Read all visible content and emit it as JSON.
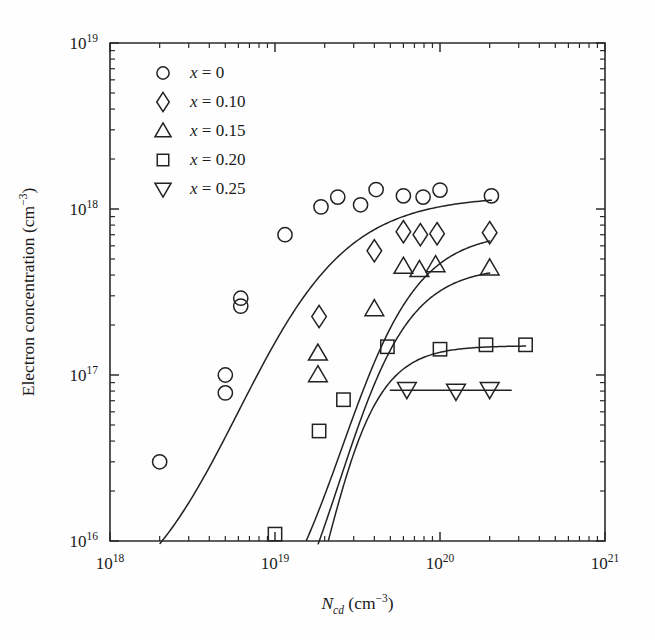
{
  "chart_data": {
    "type": "scatter",
    "title": "",
    "xlabel": "N_cd (cm^-3)",
    "ylabel": "Electron concentration (cm^-3)",
    "xscale": "log",
    "yscale": "log",
    "xlim": [
      1e+18,
      1e+21
    ],
    "ylim": [
      1e+16,
      1e+19
    ],
    "grid": false,
    "legend_position": "top-left inside",
    "xtick_labels": [
      "10^18",
      "10^19",
      "10^20",
      "10^21"
    ],
    "xtick_values": [
      1e+18,
      1e+19,
      1e+20,
      1e+21
    ],
    "ytick_labels": [
      "10^16",
      "10^17",
      "10^18",
      "10^19"
    ],
    "ytick_values": [
      1e+16,
      1e+17,
      1e+18,
      1e+19
    ],
    "series": [
      {
        "name": "x = 0",
        "marker": "circle",
        "points": [
          [
            2e+18,
            3e+16
          ],
          [
            5e+18,
            1e+17
          ],
          [
            5e+18,
            7.8e+16
          ],
          [
            6.2e+18,
            2.9e+17
          ],
          [
            6.2e+18,
            2.6e+17
          ],
          [
            1.15e+19,
            7e+17
          ],
          [
            1.9e+19,
            1.03e+18
          ],
          [
            2.4e+19,
            1.18e+18
          ],
          [
            3.3e+19,
            1.06e+18
          ],
          [
            4.1e+19,
            1.31e+18
          ],
          [
            6e+19,
            1.2e+18
          ],
          [
            7.9e+19,
            1.18e+18
          ],
          [
            1e+20,
            1.3e+18
          ],
          [
            2.05e+20,
            1.2e+18
          ]
        ],
        "fit_plateau": 1.2e+18
      },
      {
        "name": "x = 0.10",
        "marker": "diamond",
        "points": [
          [
            1.85e+19,
            2.25e+17
          ],
          [
            4e+19,
            5.6e+17
          ],
          [
            6e+19,
            7.3e+17
          ],
          [
            7.6e+19,
            7e+17
          ],
          [
            9.6e+19,
            7.1e+17
          ],
          [
            2e+20,
            7.2e+17
          ]
        ],
        "fit_plateau": 7.3e+17
      },
      {
        "name": "x = 0.15",
        "marker": "triangle-up",
        "points": [
          [
            1.82e+19,
            1.35e+17
          ],
          [
            1.82e+19,
            1e+17
          ],
          [
            4e+19,
            2.5e+17
          ],
          [
            6e+19,
            4.5e+17
          ],
          [
            7.5e+19,
            4.3e+17
          ],
          [
            9.4e+19,
            4.6e+17
          ],
          [
            2e+20,
            4.4e+17
          ]
        ],
        "fit_plateau": 4.5e+17
      },
      {
        "name": "x = 0.20",
        "marker": "square",
        "points": [
          [
            1e+19,
            1.1e+16
          ],
          [
            1.85e+19,
            4.6e+16
          ],
          [
            2.6e+19,
            7.1e+16
          ],
          [
            4.8e+19,
            1.48e+17
          ],
          [
            1e+20,
            1.43e+17
          ],
          [
            1.9e+20,
            1.52e+17
          ],
          [
            3.3e+20,
            1.52e+17
          ]
        ],
        "fit_plateau": 1.5e+17
      },
      {
        "name": "x = 0.25",
        "marker": "triangle-down",
        "points": [
          [
            6.3e+19,
            8.2e+16
          ],
          [
            1.25e+20,
            8e+16
          ],
          [
            2e+20,
            8.2e+16
          ]
        ],
        "fit_plateau": 8.1e+16,
        "fit_range": [
          5e+19,
          2.7e+20
        ]
      }
    ]
  },
  "axes": {
    "x_title_main": "N",
    "x_title_sub": "cd",
    "x_title_unit_text": " (cm",
    "x_title_unit_exp": "−3",
    "x_title_unit_close": ")",
    "y_title_text": "Electron concentration (cm",
    "y_title_exp": "−3",
    "y_title_close": ")",
    "x_ticks": [
      {
        "mantissa": "10",
        "exponent": "18",
        "value": 1e+18
      },
      {
        "mantissa": "10",
        "exponent": "19",
        "value": 1e+19
      },
      {
        "mantissa": "10",
        "exponent": "20",
        "value": 1e+20
      },
      {
        "mantissa": "10",
        "exponent": "21",
        "value": 1e+21
      }
    ],
    "y_ticks": [
      {
        "mantissa": "10",
        "exponent": "16",
        "value": 1e+16
      },
      {
        "mantissa": "10",
        "exponent": "17",
        "value": 1e+17
      },
      {
        "mantissa": "10",
        "exponent": "18",
        "value": 1e+18
      },
      {
        "mantissa": "10",
        "exponent": "19",
        "value": 1e+19
      }
    ]
  },
  "legend": {
    "entries": [
      {
        "marker": "circle",
        "var": "x",
        "eq": " = 0"
      },
      {
        "marker": "diamond",
        "var": "x",
        "eq": " = 0.10"
      },
      {
        "marker": "triangle-up",
        "var": "x",
        "eq": " = 0.15"
      },
      {
        "marker": "square",
        "var": "x",
        "eq": " = 0.20"
      },
      {
        "marker": "triangle-down",
        "var": "x",
        "eq": " = 0.25"
      }
    ]
  },
  "style": {
    "ink": "#222222",
    "background": "#fefefe"
  }
}
